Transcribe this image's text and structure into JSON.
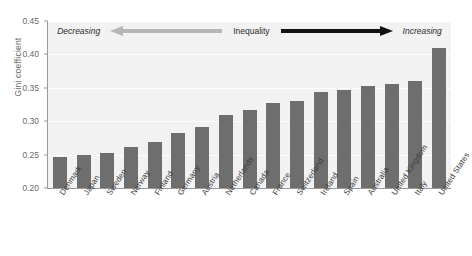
{
  "chart_data": {
    "type": "bar",
    "title": "",
    "subtitle": "",
    "xlabel": "",
    "ylabel": "Gini coefficient",
    "ylim": [
      0.2,
      0.45
    ],
    "yticks": [
      "0.20",
      "0.25",
      "0.30",
      "0.35",
      "0.40",
      "0.45"
    ],
    "ytick_values": [
      0.2,
      0.25,
      0.3,
      0.35,
      0.4,
      0.45
    ],
    "grid": true,
    "legend": "none",
    "bar_color": "#6e6e6e",
    "plot_background": "#f2f2f2",
    "categories": [
      "Denmark",
      "Japan",
      "Sweden",
      "Norway",
      "Finland",
      "Germany",
      "Austria",
      "Netherlands",
      "Canada",
      "France",
      "Switzerland",
      "Ireland",
      "Spain",
      "Australia",
      "United Kingdom",
      "Italy",
      "United States"
    ],
    "values": [
      0.247,
      0.249,
      0.252,
      0.261,
      0.269,
      0.283,
      0.291,
      0.309,
      0.317,
      0.327,
      0.331,
      0.343,
      0.347,
      0.352,
      0.355,
      0.36,
      0.41
    ],
    "annotations": {
      "left_word": "Decreasing",
      "center_word": "Inequality",
      "right_word": "Increasing",
      "left_arrow_color": "#b6b6b6",
      "right_arrow_color": "#111111"
    }
  }
}
